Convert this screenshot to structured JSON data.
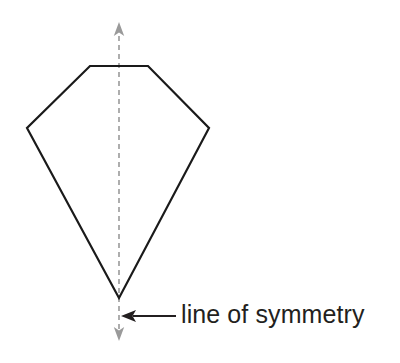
{
  "figure": {
    "type": "geometry-diagram",
    "background_color": "#ffffff",
    "shape": {
      "name": "kite-pentagon",
      "stroke_color": "#1a1a1a",
      "stroke_width": 2.2,
      "fill": "none",
      "vertices": [
        {
          "label": "top-left",
          "x": 90,
          "y": 66
        },
        {
          "label": "top-right",
          "x": 148,
          "y": 66
        },
        {
          "label": "right",
          "x": 209,
          "y": 128
        },
        {
          "label": "bottom",
          "x": 119,
          "y": 298
        },
        {
          "label": "left",
          "x": 27,
          "y": 128
        }
      ]
    },
    "symmetry_line": {
      "orientation": "vertical",
      "x": 119,
      "y_top": 22,
      "y_bottom": 341,
      "color": "#9a9a9a",
      "stroke_width": 1.6,
      "dash_pattern": "5 4",
      "arrowheads": [
        "top",
        "bottom"
      ]
    },
    "pointer_arrow": {
      "direction": "left",
      "from_x": 176,
      "to_x": 122,
      "y": 316,
      "color": "#231f20",
      "stroke_width": 2.2
    },
    "annotation": {
      "text": "line of symmetry",
      "color": "#231f20",
      "font_size_px": 25,
      "x": 181,
      "y": 299
    }
  }
}
